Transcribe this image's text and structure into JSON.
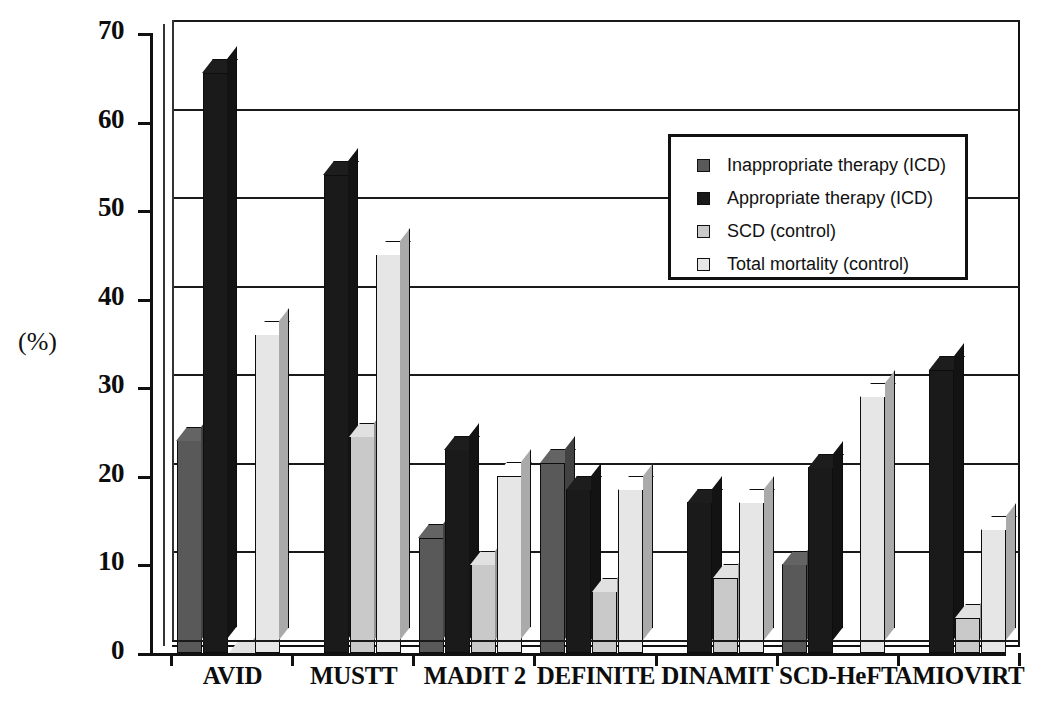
{
  "chart_data": {
    "type": "bar",
    "title": "",
    "xlabel": "",
    "ylabel": "(%)",
    "ylim": [
      0,
      70
    ],
    "ytick_step": 10,
    "grid": true,
    "legend_position": "upper-right-inside",
    "categories": [
      "AVID",
      "MUSTT",
      "MADIT 2",
      "DEFINITE",
      "DINAMIT",
      "SCD-HeFT",
      "AMIOVIRT"
    ],
    "series": [
      {
        "name": "Inappropriate therapy (ICD)",
        "color": "#595959",
        "values": [
          24,
          null,
          13,
          21.5,
          null,
          10,
          null
        ]
      },
      {
        "name": "Appropriate therapy (ICD)",
        "color": "#1a1a1a",
        "values": [
          65.5,
          54,
          23,
          18.5,
          17,
          21,
          32
        ]
      },
      {
        "name": "SCD (control)",
        "color": "#c9c9c9",
        "values": [
          0,
          24.5,
          10,
          7,
          8.5,
          null,
          4
        ]
      },
      {
        "name": "Total mortality (control)",
        "color": "#e6e6e6",
        "values": [
          36,
          45,
          20,
          18.5,
          17,
          29,
          14
        ]
      }
    ],
    "ytick_labels": [
      "70",
      "60",
      "50",
      "40",
      "30",
      "20",
      "10",
      "0"
    ]
  },
  "legend": {
    "items": [
      {
        "label": "Inappropriate therapy (ICD)",
        "color": "#595959"
      },
      {
        "label": "Appropriate therapy (ICD)",
        "color": "#1a1a1a"
      },
      {
        "label": "SCD (control)",
        "color": "#c9c9c9"
      },
      {
        "label": "Total mortality (control)",
        "color": "#e6e6e6"
      }
    ]
  },
  "axis": {
    "unit_label": "(%)"
  }
}
